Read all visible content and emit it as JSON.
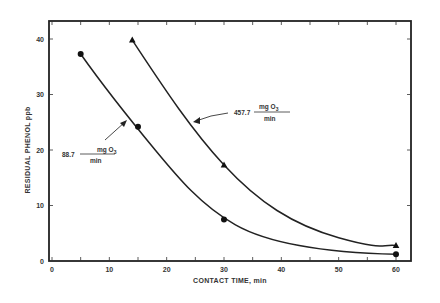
{
  "chart_data": {
    "type": "line",
    "title": "",
    "xlabel": "CONTACT TIME, min",
    "ylabel": "RESIDUAL PHENOL ppb",
    "xlim": [
      0,
      63
    ],
    "ylim": [
      0,
      43
    ],
    "xticks": [
      0,
      10,
      20,
      30,
      40,
      50,
      60
    ],
    "xtick_labels": [
      "0",
      "10",
      "20",
      "30",
      "40",
      "50",
      "60"
    ],
    "yticks": [
      0,
      10,
      20,
      30,
      40
    ],
    "ytick_labels": [
      "0",
      "10",
      "20",
      "30",
      "40"
    ],
    "grid": false,
    "series": [
      {
        "name": "88.7 mg O3/min",
        "marker": "circle",
        "x": [
          5,
          15,
          30,
          60
        ],
        "y": [
          37.3,
          24.2,
          7.5,
          1.2
        ]
      },
      {
        "name": "457.7 mg O3/min",
        "marker": "triangle",
        "x": [
          14,
          30,
          60
        ],
        "y": [
          39.8,
          17.3,
          2.8
        ]
      }
    ],
    "annotations": [
      {
        "value": "88.7",
        "numerator": "mg O",
        "subscript": "3",
        "denominator": "min",
        "points_to": "circle series"
      },
      {
        "value": "457.7",
        "numerator": "mg O",
        "subscript": "3",
        "denominator": "min",
        "points_to": "triangle series"
      }
    ]
  }
}
